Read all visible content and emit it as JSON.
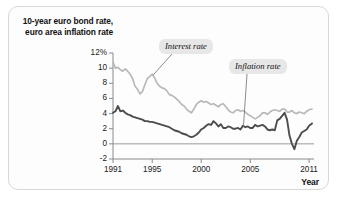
{
  "figure": {
    "y_axis_title": "10-year euro bond rate, euro area inflation rate",
    "x_axis_title": "Year"
  },
  "annotations": {
    "interest_label": "Interest rate",
    "inflation_label": "Inflation rate"
  },
  "colors": {
    "interest_rate_line": "#b9b9b9",
    "inflation_rate_line": "#4d4d4d",
    "axis": "#8a8a8a",
    "zero_line": "#9a9a9a",
    "callout_bg": "#e7e7e7",
    "panel_border": "#d8d8d8",
    "panel_bg": "#fdfdfd"
  },
  "chart_data": {
    "type": "line",
    "title": "10-year euro bond rate, euro area inflation rate",
    "xlabel": "Year",
    "ylabel": "10-year euro bond rate, euro area inflation rate",
    "xlim": [
      1991,
      2011.5
    ],
    "ylim": [
      -2,
      12
    ],
    "grid": false,
    "legend_position": "inline-annotations",
    "ytick_labels": [
      "12%",
      "10",
      "8",
      "6",
      "4",
      "2",
      "0",
      "-2"
    ],
    "yticks": [
      12,
      10,
      8,
      6,
      4,
      2,
      0,
      -2
    ],
    "xtick_labels": [
      "1991",
      "1995",
      "2000",
      "2005",
      "2011"
    ],
    "xticks": [
      1991,
      1995,
      2000,
      2005,
      2011
    ],
    "series": [
      {
        "name": "Interest rate",
        "color": "#b9b9b9",
        "x": [
          1991.0,
          1991.25,
          1991.5,
          1991.75,
          1992.0,
          1992.25,
          1992.5,
          1992.75,
          1993.0,
          1993.25,
          1993.5,
          1993.75,
          1994.0,
          1994.25,
          1994.5,
          1994.75,
          1995.0,
          1995.25,
          1995.5,
          1995.75,
          1996.0,
          1996.25,
          1996.5,
          1996.75,
          1997.0,
          1997.25,
          1997.5,
          1997.75,
          1998.0,
          1998.25,
          1998.5,
          1998.75,
          1999.0,
          1999.25,
          1999.5,
          1999.75,
          2000.0,
          2000.25,
          2000.5,
          2000.75,
          2001.0,
          2001.25,
          2001.5,
          2001.75,
          2002.0,
          2002.25,
          2002.5,
          2002.75,
          2003.0,
          2003.25,
          2003.5,
          2003.75,
          2004.0,
          2004.25,
          2004.5,
          2004.75,
          2005.0,
          2005.25,
          2005.5,
          2005.75,
          2006.0,
          2006.25,
          2006.5,
          2006.75,
          2007.0,
          2007.25,
          2007.5,
          2007.75,
          2008.0,
          2008.25,
          2008.5,
          2008.75,
          2009.0,
          2009.25,
          2009.5,
          2009.75,
          2010.0,
          2010.25,
          2010.5,
          2010.75,
          2011.0,
          2011.3
        ],
        "values": [
          10.8,
          10.0,
          10.1,
          9.8,
          9.6,
          9.9,
          9.6,
          9.2,
          8.6,
          7.6,
          7.2,
          6.6,
          6.9,
          7.8,
          8.6,
          8.9,
          9.2,
          8.7,
          8.0,
          7.6,
          7.4,
          7.3,
          7.0,
          6.5,
          6.4,
          6.2,
          5.9,
          5.6,
          5.2,
          5.0,
          4.6,
          4.3,
          4.1,
          4.6,
          5.2,
          5.5,
          5.7,
          5.5,
          5.6,
          5.4,
          5.2,
          5.3,
          5.1,
          4.9,
          5.2,
          5.3,
          4.9,
          4.5,
          4.2,
          4.1,
          4.4,
          4.5,
          4.3,
          4.4,
          4.2,
          3.9,
          3.7,
          3.5,
          3.3,
          3.5,
          3.7,
          4.1,
          4.1,
          3.9,
          4.2,
          4.4,
          4.5,
          4.4,
          4.3,
          4.6,
          4.6,
          4.2,
          4.2,
          4.4,
          4.1,
          4.0,
          4.2,
          4.1,
          4.0,
          4.3,
          4.5,
          4.6
        ]
      },
      {
        "name": "Inflation rate",
        "color": "#4d4d4d",
        "x": [
          1991.0,
          1991.25,
          1991.5,
          1991.75,
          1992.0,
          1992.25,
          1992.5,
          1992.75,
          1993.0,
          1993.25,
          1993.5,
          1993.75,
          1994.0,
          1994.25,
          1994.5,
          1994.75,
          1995.0,
          1995.25,
          1995.5,
          1995.75,
          1996.0,
          1996.25,
          1996.5,
          1996.75,
          1997.0,
          1997.25,
          1997.5,
          1997.75,
          1998.0,
          1998.25,
          1998.5,
          1998.75,
          1999.0,
          1999.25,
          1999.5,
          1999.75,
          2000.0,
          2000.25,
          2000.5,
          2000.75,
          2001.0,
          2001.25,
          2001.5,
          2001.75,
          2002.0,
          2002.25,
          2002.5,
          2002.75,
          2003.0,
          2003.25,
          2003.5,
          2003.75,
          2004.0,
          2004.25,
          2004.5,
          2004.75,
          2005.0,
          2005.25,
          2005.5,
          2005.75,
          2006.0,
          2006.25,
          2006.5,
          2006.75,
          2007.0,
          2007.25,
          2007.5,
          2007.75,
          2008.0,
          2008.25,
          2008.5,
          2008.75,
          2009.0,
          2009.25,
          2009.5,
          2009.75,
          2010.0,
          2010.25,
          2010.5,
          2010.75,
          2011.0,
          2011.3
        ],
        "values": [
          4.1,
          4.3,
          5.0,
          4.3,
          4.4,
          4.1,
          3.9,
          3.8,
          3.6,
          3.5,
          3.4,
          3.3,
          3.2,
          3.0,
          3.0,
          2.9,
          2.9,
          2.8,
          2.7,
          2.6,
          2.5,
          2.4,
          2.3,
          2.2,
          2.0,
          1.8,
          1.7,
          1.6,
          1.4,
          1.3,
          1.2,
          1.0,
          0.9,
          1.0,
          1.2,
          1.5,
          1.9,
          2.1,
          2.4,
          2.6,
          2.5,
          3.0,
          2.7,
          2.3,
          2.6,
          2.1,
          2.1,
          2.3,
          2.2,
          2.0,
          2.0,
          2.1,
          1.9,
          2.4,
          2.2,
          2.3,
          2.1,
          2.1,
          2.5,
          2.3,
          2.4,
          2.5,
          2.3,
          1.9,
          1.8,
          1.9,
          1.8,
          3.1,
          3.3,
          3.7,
          4.1,
          3.2,
          1.1,
          0.0,
          -0.7,
          0.4,
          0.9,
          1.5,
          1.7,
          1.9,
          2.4,
          2.7
        ]
      }
    ]
  }
}
